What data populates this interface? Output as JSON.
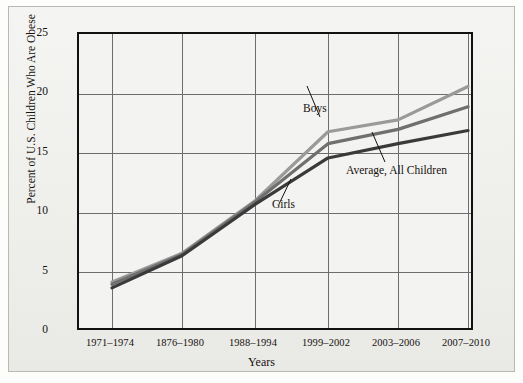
{
  "chart_data": {
    "type": "line",
    "title": "",
    "subtitle": "",
    "xlabel": "Years",
    "ylabel": "Percent of U.S. Children Who Are Obese",
    "categories": [
      "1971–1974",
      "1876–1980",
      "1988–1994",
      "1999–2002",
      "2003–2006",
      "2007–2010"
    ],
    "x_tick_labels": [
      "1971–1974",
      "1876–1980",
      "1988–1994",
      "1999–2002",
      "2003–2006",
      "2007–2010"
    ],
    "y_tick_labels": [
      "0",
      "5",
      "10",
      "15",
      "20",
      "25"
    ],
    "y_tick_values": [
      0,
      5,
      10,
      15,
      20,
      25
    ],
    "ylim": [
      0,
      25
    ],
    "grid": "both",
    "legend_position": "inline-annotations",
    "series": [
      {
        "name": "Boys",
        "color": "#9a9a9a",
        "values": [
          4.2,
          6.6,
          11.0,
          16.8,
          17.8,
          20.6
        ]
      },
      {
        "name": "Average, All Children",
        "color": "#6f6f6f",
        "values": [
          4.0,
          6.5,
          10.9,
          15.8,
          17.0,
          18.9
        ]
      },
      {
        "name": "Girls",
        "color": "#3a3a3a",
        "values": [
          3.7,
          6.4,
          10.7,
          14.6,
          15.8,
          16.9
        ]
      }
    ],
    "annotations": [
      {
        "id": "boys-label",
        "text": "Boys",
        "points_to_series": "Boys"
      },
      {
        "id": "average-label",
        "text": "Average, All Children",
        "points_to_series": "Average, All Children"
      },
      {
        "id": "girls-label",
        "text": "Girls",
        "points_to_series": "Girls"
      }
    ]
  }
}
